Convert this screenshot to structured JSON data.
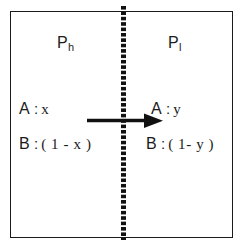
{
  "figure": {
    "type": "membrane-transport-diagram",
    "background_color": "#ffffff",
    "line_color": "#1a1a1a"
  },
  "compartments": {
    "left": {
      "label_base": "P",
      "label_sub": "h",
      "species": [
        {
          "name": "A",
          "separator": ":",
          "value": "x"
        },
        {
          "name": "B",
          "separator": ":",
          "value": "( 1 - x )"
        }
      ]
    },
    "right": {
      "label_base": "P",
      "label_sub": "l",
      "species": [
        {
          "name": "A",
          "separator": ":",
          "value": "y"
        },
        {
          "name": "B",
          "separator": ":",
          "value": "( 1- y )"
        }
      ]
    }
  },
  "divider": {
    "name": "dotted-membrane",
    "style": "dotted",
    "color": "#111111"
  },
  "arrow": {
    "name": "transport-arrow",
    "direction": "right",
    "color": "#111111"
  }
}
